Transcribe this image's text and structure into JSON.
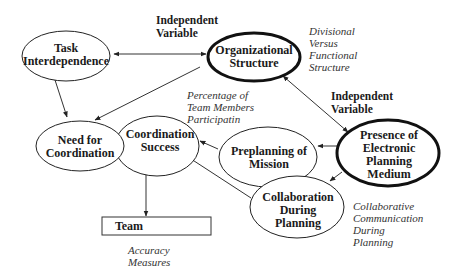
{
  "diagram": {
    "nodes": {
      "task_interdependence": {
        "line1": "Task",
        "line2": "Interdependence"
      },
      "organizational_structure": {
        "line1": "Organizational",
        "line2": "Structure"
      },
      "need_for_coordination": {
        "line1": "Need for",
        "line2": "Coordination"
      },
      "coordination_success": {
        "line1": "Coordination",
        "line2": "Success"
      },
      "preplanning_of_mission": {
        "line1": "Preplanning of",
        "line2": "Mission"
      },
      "presence_of_electronic_planning_medium": {
        "line1": "Presence of",
        "line2": "Electronic",
        "line3": "Planning",
        "line4": "Medium"
      },
      "collaboration_during_planning": {
        "line1": "Collaboration",
        "line2": "During",
        "line3": "Planning"
      },
      "team": {
        "label": "Team"
      }
    },
    "labels": {
      "independent_variable_1": {
        "line1": "Independent",
        "line2": "Variable"
      },
      "independent_variable_2": {
        "line1": "Independent",
        "line2": "Variable"
      }
    },
    "notes": {
      "divisional": {
        "line1": "Divisional",
        "line2": "Versus",
        "line3": "Functional",
        "line4": "Structure"
      },
      "percentage": {
        "line1": "Percentage of",
        "line2": "Team Members",
        "line3": "Participatin"
      },
      "collaborative": {
        "line1": "Collaborative",
        "line2": "Communication",
        "line3": "During",
        "line4": "Planning"
      },
      "accuracy": {
        "line1": "Accuracy",
        "line2": "Measures"
      }
    }
  }
}
